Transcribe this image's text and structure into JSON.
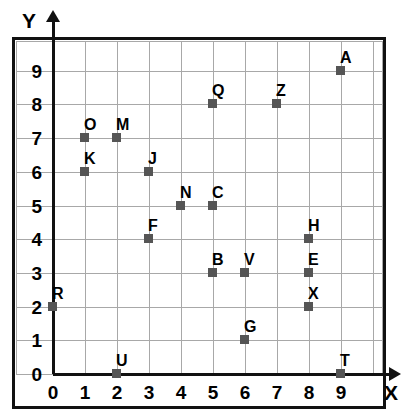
{
  "chart_data": {
    "type": "scatter",
    "title": "",
    "xlabel": "X",
    "ylabel": "Y",
    "xlim": [
      0,
      9
    ],
    "ylim": [
      0,
      9
    ],
    "xticks": [
      "0",
      "1",
      "2",
      "3",
      "4",
      "5",
      "6",
      "7",
      "8",
      "9"
    ],
    "yticks": [
      "0",
      "1",
      "2",
      "3",
      "4",
      "5",
      "6",
      "7",
      "8",
      "9"
    ],
    "grid": true,
    "legend": "none",
    "marker_color": "#555555",
    "grid_color": "#a8a8a8",
    "axis_color": "#111111",
    "points": [
      {
        "label": "A",
        "x": 9,
        "y": 9
      },
      {
        "label": "Q",
        "x": 5,
        "y": 8
      },
      {
        "label": "Z",
        "x": 7,
        "y": 8
      },
      {
        "label": "O",
        "x": 1,
        "y": 7
      },
      {
        "label": "M",
        "x": 2,
        "y": 7
      },
      {
        "label": "K",
        "x": 1,
        "y": 6
      },
      {
        "label": "J",
        "x": 3,
        "y": 6
      },
      {
        "label": "N",
        "x": 4,
        "y": 5
      },
      {
        "label": "C",
        "x": 5,
        "y": 5
      },
      {
        "label": "F",
        "x": 3,
        "y": 4
      },
      {
        "label": "H",
        "x": 8,
        "y": 4
      },
      {
        "label": "B",
        "x": 5,
        "y": 3
      },
      {
        "label": "V",
        "x": 6,
        "y": 3
      },
      {
        "label": "E",
        "x": 8,
        "y": 3
      },
      {
        "label": "R",
        "x": 0,
        "y": 2
      },
      {
        "label": "X",
        "x": 8,
        "y": 2
      },
      {
        "label": "G",
        "x": 6,
        "y": 1
      },
      {
        "label": "T",
        "x": 9,
        "y": 0
      },
      {
        "label": "U",
        "x": 2,
        "y": 0
      }
    ]
  }
}
